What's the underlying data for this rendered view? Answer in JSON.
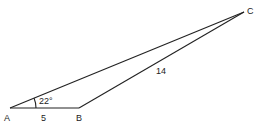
{
  "diagram": {
    "type": "triangle",
    "vertices": {
      "A": {
        "label": "A"
      },
      "B": {
        "label": "B"
      },
      "C": {
        "label": "C"
      }
    },
    "sides": {
      "AB": {
        "label": "5"
      },
      "BC": {
        "label": "14"
      }
    },
    "angles": {
      "A": {
        "label": "22°"
      }
    },
    "colors": {
      "stroke": "#222222",
      "background": "#ffffff"
    }
  }
}
